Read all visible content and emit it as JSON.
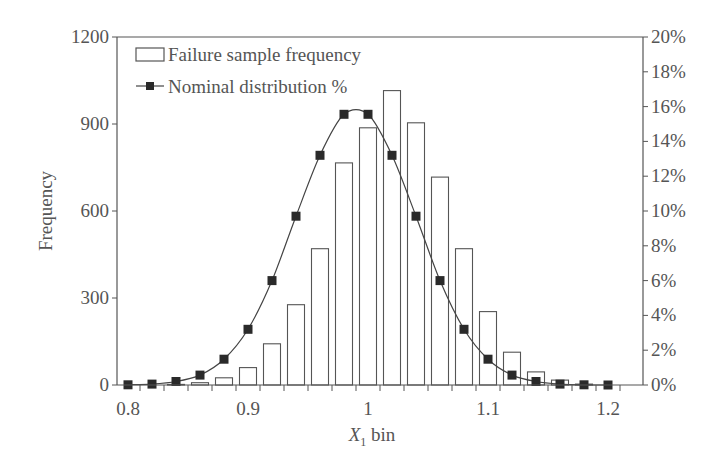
{
  "chart_data": {
    "type": "bar+line",
    "title": "",
    "xlabel": "X1 bin",
    "xlabel_main": "X",
    "xlabel_sub": "1",
    "xlabel_suffix": " bin",
    "ylabel": "Frequency",
    "ylabel_right": "",
    "x": [
      0.8,
      0.82,
      0.84,
      0.86,
      0.88,
      0.9,
      0.92,
      0.94,
      0.96,
      0.98,
      1.0,
      1.02,
      1.04,
      1.06,
      1.08,
      1.1,
      1.12,
      1.14,
      1.16,
      1.18,
      1.2
    ],
    "series": [
      {
        "name": "Failure sample frequency",
        "type": "bar",
        "axis": "left",
        "values": [
          0,
          0,
          2,
          8,
          25,
          60,
          142,
          277,
          470,
          766,
          887,
          1015,
          904,
          717,
          470,
          253,
          113,
          45,
          17,
          3,
          0
        ]
      },
      {
        "name": "Nominal distribution %",
        "type": "line",
        "marker": "square",
        "axis": "right",
        "values": [
          0.01,
          0.05,
          0.2,
          0.57,
          1.48,
          3.2,
          6.0,
          9.7,
          13.2,
          15.56,
          15.56,
          13.2,
          9.7,
          6.0,
          3.2,
          1.48,
          0.57,
          0.2,
          0.05,
          0.01,
          0.0
        ]
      }
    ],
    "xlim": [
      0.79,
      1.23
    ],
    "ylim": [
      0,
      1200
    ],
    "ylim_right": [
      0,
      20
    ],
    "x_tick_labels": [
      "0.8",
      "0.9",
      "1",
      "1.1",
      "1.2"
    ],
    "y_tick_labels": [
      "0",
      "300",
      "600",
      "900",
      "1200"
    ],
    "y_right_tick_labels": [
      "0%",
      "2%",
      "4%",
      "6%",
      "8%",
      "10%",
      "12%",
      "14%",
      "16%",
      "18%",
      "20%"
    ],
    "grid": false,
    "legend_position": "upper-left-inside"
  },
  "legend": {
    "bar_label": "Failure sample frequency",
    "line_label": "Nominal distribution %"
  },
  "axes": {
    "xlabel_main": "X",
    "xlabel_sub": "1",
    "xlabel_suffix": " bin",
    "ylabel": "Frequency"
  },
  "colors": {
    "axis": "#555555",
    "bar_fill": "#ffffff",
    "bar_stroke": "#555555",
    "line": "#444444",
    "marker": "#2a2a2a"
  }
}
